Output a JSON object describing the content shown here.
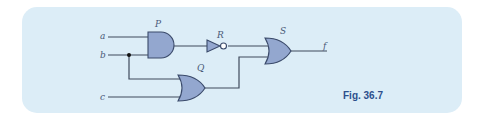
{
  "figure": {
    "caption": "Fig. 36.7",
    "panel_color": "#dcedf7",
    "gate_fill": "#93a7cf",
    "caption_color": "#2d4f8c"
  },
  "inputs": {
    "a": "a",
    "b": "b",
    "c": "c"
  },
  "output": "f",
  "gates": {
    "P": {
      "label": "P",
      "type": "AND",
      "inputs": [
        "a",
        "b"
      ]
    },
    "R": {
      "label": "R",
      "type": "NOT",
      "inputs": [
        "P"
      ]
    },
    "Q": {
      "label": "Q",
      "type": "OR",
      "inputs": [
        "b",
        "c"
      ]
    },
    "S": {
      "label": "S",
      "type": "OR",
      "inputs": [
        "R",
        "Q"
      ]
    }
  }
}
